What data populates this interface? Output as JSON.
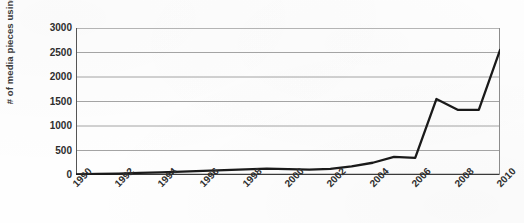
{
  "chart_data": {
    "type": "line",
    "title": "",
    "xlabel": "",
    "ylabel": "# of media pieces using the term",
    "x": [
      1990,
      1991,
      1992,
      1993,
      1994,
      1995,
      1996,
      1997,
      1998,
      1999,
      2000,
      2001,
      2002,
      2003,
      2004,
      2005,
      2006,
      2007,
      2008,
      2009,
      2010
    ],
    "values": [
      10,
      20,
      30,
      45,
      55,
      70,
      85,
      100,
      115,
      130,
      120,
      110,
      125,
      175,
      250,
      370,
      350,
      1550,
      1330,
      1330,
      2550
    ],
    "series": [
      {
        "name": "# of media pieces using the term",
        "values": [
          10,
          20,
          30,
          45,
          55,
          70,
          85,
          100,
          115,
          130,
          120,
          110,
          125,
          175,
          250,
          370,
          350,
          1550,
          1330,
          1330,
          2550
        ]
      }
    ],
    "xtick_labels": [
      "1990",
      "1992",
      "1994",
      "1996",
      "1998",
      "2000",
      "2002",
      "2004",
      "2006",
      "2008",
      "2010"
    ],
    "xtick_values": [
      1990,
      1992,
      1994,
      1996,
      1998,
      2000,
      2002,
      2004,
      2006,
      2008,
      2010
    ],
    "ytick_labels": [
      "0",
      "500",
      "1000",
      "1500",
      "2000",
      "2500",
      "3000"
    ],
    "ytick_values": [
      0,
      500,
      1000,
      1500,
      2000,
      2500,
      3000
    ],
    "ylim": [
      0,
      3000
    ],
    "xlim": [
      1990,
      2010
    ],
    "grid": "horizontal",
    "legend": "none",
    "line_color": "#1a1a1a",
    "grid_color": "#9a9a9a",
    "axis_color": "#555555",
    "background_color": "#ffffff"
  }
}
